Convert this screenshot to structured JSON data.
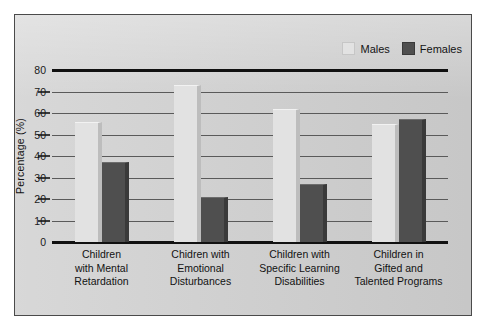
{
  "chart_data": {
    "type": "bar",
    "title": "",
    "subtitle": "",
    "xlabel": "",
    "ylabel": "Percentage (%)",
    "ylim": [
      0,
      80
    ],
    "yticks": [
      0,
      10,
      20,
      30,
      40,
      50,
      60,
      70,
      80
    ],
    "grid": true,
    "legend_position": "top-right",
    "categories": [
      "Children with Mental Retardation",
      "Chidren with Emotional Disturbances",
      "Children with Specific Learning Disabilities",
      "Children in Gifted and Talented Programs"
    ],
    "category_lines": [
      [
        "Children",
        "with Mental",
        "Retardation"
      ],
      [
        "Chidren with",
        "Emotional",
        "Disturbances"
      ],
      [
        "Children with",
        "Specific Learning",
        "Disabilities"
      ],
      [
        "Children in",
        "Gifted and",
        "Talented Programs"
      ]
    ],
    "series": [
      {
        "name": "Males",
        "color": "#e2e2e2",
        "values": [
          56,
          73,
          62,
          55
        ]
      },
      {
        "name": "Females",
        "color": "#4f4f4f",
        "values": [
          37,
          21,
          27,
          57
        ]
      }
    ]
  },
  "axis": {
    "y_title": "Percentage (%)",
    "tick_labels": [
      "80",
      "70",
      "60",
      "50",
      "40",
      "30",
      "20",
      "10",
      "0"
    ]
  },
  "legend": {
    "items": [
      {
        "label": "Males",
        "swatch": "legend-swatch-males"
      },
      {
        "label": "Females",
        "swatch": "legend-swatch-females"
      }
    ]
  },
  "colors": {
    "panel_background": "#cfcfcf",
    "page_background": "#ffffff",
    "frame": "#4a4a4a",
    "gridline": "#5a5a5a",
    "axis_heavy": "#111111",
    "males_bar": "#e2e2e2",
    "females_bar": "#4f4f4f"
  }
}
